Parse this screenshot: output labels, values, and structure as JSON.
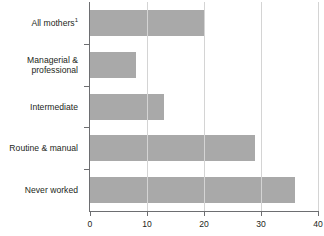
{
  "chart_data": {
    "type": "bar",
    "orientation": "horizontal",
    "title": "",
    "subtitle": "",
    "xlabel": "",
    "ylabel": "",
    "categories": [
      "All mothers",
      "Managerial & professional",
      "Intermediate",
      "Routine & manual",
      "Never worked"
    ],
    "category_labels_display": [
      {
        "text": "All mothers",
        "superscript": "1",
        "lines": [
          "All mothers"
        ]
      },
      {
        "text": "Managerial & professional",
        "superscript": "",
        "lines": [
          "Managerial &",
          "professional"
        ]
      },
      {
        "text": "Intermediate",
        "superscript": "",
        "lines": [
          "Intermediate"
        ]
      },
      {
        "text": "Routine & manual",
        "superscript": "",
        "lines": [
          "Routine & manual"
        ]
      },
      {
        "text": "Never worked",
        "superscript": "",
        "lines": [
          "Never worked"
        ]
      }
    ],
    "values": [
      20,
      8,
      13,
      29,
      36
    ],
    "xlim": [
      0,
      40
    ],
    "xticks": [
      0,
      10,
      20,
      30,
      40
    ],
    "xtick_labels": [
      "0",
      "10",
      "20",
      "30",
      "40"
    ],
    "grid": true,
    "grid_axis": "x",
    "legend": "none",
    "series": [
      {
        "name": "Percentage",
        "values": [
          20,
          8,
          13,
          29,
          36
        ],
        "color": "#a9a9a9"
      }
    ]
  },
  "colors": {
    "bar_fill": "#a9a9a9",
    "gridline": "#d4d4d4",
    "axis": "#6d6e71",
    "text": "#231f20",
    "background": "#ffffff"
  },
  "footnote": {
    "text": ""
  }
}
